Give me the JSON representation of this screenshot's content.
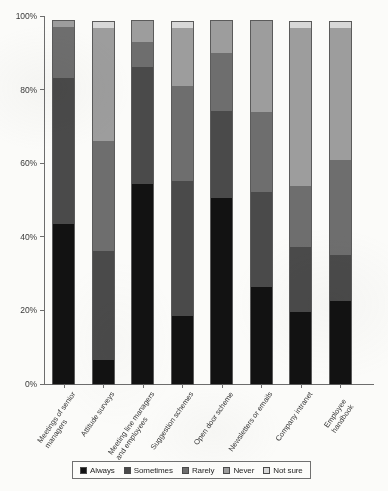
{
  "chart_data": {
    "type": "bar",
    "subtype": "stacked-100-percent",
    "title": "",
    "subtitle": "",
    "xlabel": "",
    "ylabel": "",
    "ylim": [
      0,
      100
    ],
    "y_tick_labels": [
      "0%",
      "20%",
      "40%",
      "60%",
      "80%",
      "100%"
    ],
    "y_tick_values": [
      0,
      20,
      40,
      60,
      80,
      100
    ],
    "grid": false,
    "legend_position": "bottom",
    "orientation": "vertical",
    "categories": [
      "Meetings of senior\nmanagers",
      "Attitude surveys",
      "Meeting line managers\nand employees",
      "Suggestion schemes",
      "Open door scheme",
      "Newsletters or emails",
      "Company intranet",
      "Employee handbook"
    ],
    "series": [
      {
        "name": "Always",
        "color": "#121212",
        "values": [
          44,
          7,
          55,
          19,
          51,
          27,
          20,
          23
        ]
      },
      {
        "name": "Sometimes",
        "color": "#4a4a4a",
        "values": [
          40,
          30,
          32,
          37,
          24,
          26,
          18,
          13
        ]
      },
      {
        "name": "Rarely",
        "color": "#6e6e6e",
        "values": [
          14,
          30,
          7,
          26,
          16,
          22,
          17,
          26
        ]
      },
      {
        "name": "Never",
        "color": "#9d9d9d",
        "values": [
          2,
          31,
          6,
          16,
          9,
          25,
          43,
          36
        ]
      },
      {
        "name": "Not sure",
        "color": "#d8d8d8",
        "values": [
          0,
          2,
          0,
          2,
          0,
          0,
          2,
          2
        ]
      }
    ]
  },
  "legend": {
    "items": [
      {
        "label": "Always",
        "color": "#121212"
      },
      {
        "label": "Sometimes",
        "color": "#4a4a4a"
      },
      {
        "label": "Rarely",
        "color": "#6e6e6e"
      },
      {
        "label": "Never",
        "color": "#9d9d9d"
      },
      {
        "label": "Not sure",
        "color": "#d8d8d8"
      }
    ]
  }
}
